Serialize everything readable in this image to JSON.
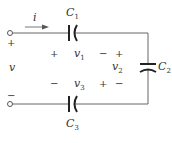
{
  "diagram": {
    "type": "circuit",
    "current": {
      "label": "i",
      "direction": "right"
    },
    "source_voltage": {
      "label": "v",
      "plus": "+",
      "minus": "−"
    },
    "capacitors": [
      {
        "id": "C1",
        "name": "C",
        "sub": "1",
        "position": "top-series",
        "voltage": {
          "name": "v",
          "sub": "1",
          "left_sign": "+",
          "right_sign": "−"
        }
      },
      {
        "id": "C2",
        "name": "C",
        "sub": "2",
        "position": "right-shunt",
        "voltage": {
          "name": "v",
          "sub": "2",
          "top_sign": "+",
          "bottom_sign": "−"
        }
      },
      {
        "id": "C3",
        "name": "C",
        "sub": "3",
        "position": "bottom-series",
        "voltage": {
          "name": "v",
          "sub": "3",
          "left_sign": "−",
          "right_sign": "+"
        }
      }
    ]
  }
}
